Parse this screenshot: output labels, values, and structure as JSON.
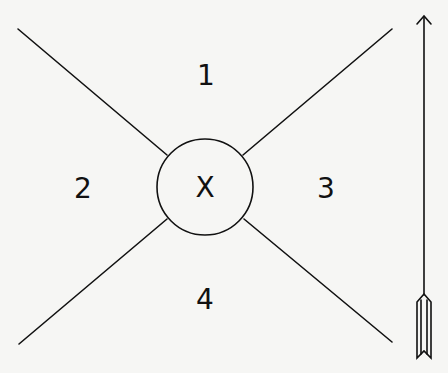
{
  "diagram": {
    "type": "quadrant-diagram",
    "center": {
      "label": "X",
      "shape": "circle"
    },
    "regions": [
      {
        "id": "top",
        "label": "1"
      },
      {
        "id": "left",
        "label": "2"
      },
      {
        "id": "right",
        "label": "3"
      },
      {
        "id": "bottom",
        "label": "4"
      }
    ],
    "arrow": {
      "icon": "upward-arrow-icon",
      "direction": "up"
    },
    "colors": {
      "stroke": "#111111",
      "background": "#f6f6f4"
    }
  }
}
